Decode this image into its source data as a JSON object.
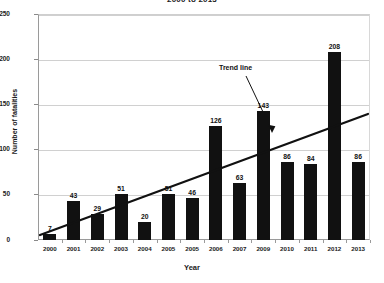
{
  "chart_data": {
    "type": "bar",
    "title": "2000 to 2013",
    "xlabel": "Year",
    "ylabel": "Number of fatalities",
    "categories": [
      "2000",
      "2001",
      "2002",
      "2003",
      "2004",
      "2005",
      "2005",
      "2006",
      "2007",
      "2009",
      "2010",
      "2011",
      "2012",
      "2013"
    ],
    "values": [
      7,
      43,
      29,
      51,
      20,
      51,
      46,
      126,
      63,
      143,
      86,
      84,
      208,
      86
    ],
    "data_labels": [
      "7",
      "43",
      "29",
      "51",
      "20",
      "51",
      "46",
      "126",
      "63",
      "143",
      "86",
      "84",
      "208",
      "86"
    ],
    "ylim": [
      0,
      250
    ],
    "yticks": [
      0,
      50,
      100,
      150,
      200,
      250
    ],
    "ytick_labels": [
      "0",
      "50",
      "100",
      "150",
      "200",
      "250"
    ],
    "grid": true,
    "legend": "none",
    "bar_color": "#111111",
    "gridline_color": "#d0d0d0",
    "axis_color": "#9a9a9a",
    "annotations": [
      {
        "name": "trend-line-callout",
        "text": "Trend line",
        "points_to": "trend line"
      }
    ],
    "series": [
      {
        "name": "Fatalities",
        "type": "bar",
        "values": [
          7,
          43,
          29,
          51,
          20,
          51,
          46,
          126,
          63,
          143,
          86,
          84,
          208,
          86
        ]
      },
      {
        "name": "Trend line",
        "type": "line",
        "start_value": 5,
        "end_value": 138
      }
    ]
  }
}
